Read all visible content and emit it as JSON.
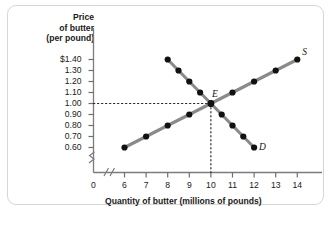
{
  "chart_data": {
    "type": "line",
    "title": "",
    "ylabel": "Price of butter (per pound)",
    "ylabel_lines": [
      "Price",
      "of butter",
      "(per pound)"
    ],
    "xlabel": "Quantity of butter (millions of pounds)",
    "xlim": [
      6,
      14
    ],
    "ylim": [
      0.6,
      1.4
    ],
    "x_origin_label": "0",
    "axis_break_x": true,
    "axis_break_y": true,
    "grid": false,
    "legend_position": "inline-curve-end",
    "ytick_labels": [
      "$1.40",
      "1.30",
      "1.20",
      "1.10",
      "1.00",
      "0.90",
      "0.80",
      "0.70",
      "0.60"
    ],
    "ytick_values": [
      1.4,
      1.3,
      1.2,
      1.1,
      1.0,
      0.9,
      0.8,
      0.7,
      0.6
    ],
    "xtick_labels": [
      "6",
      "7",
      "8",
      "9",
      "10",
      "11",
      "12",
      "13",
      "14"
    ],
    "xtick_values": [
      6,
      7,
      8,
      9,
      10,
      11,
      12,
      13,
      14
    ],
    "series": [
      {
        "name": "S",
        "label": "S",
        "color": "#8a8a8a",
        "marker_color": "#111111",
        "points": [
          {
            "x": 6.0,
            "y": 0.6
          },
          {
            "x": 7.0,
            "y": 0.7
          },
          {
            "x": 8.0,
            "y": 0.8
          },
          {
            "x": 9.0,
            "y": 0.9
          },
          {
            "x": 10.0,
            "y": 1.0
          },
          {
            "x": 11.0,
            "y": 1.1
          },
          {
            "x": 12.0,
            "y": 1.2
          },
          {
            "x": 13.0,
            "y": 1.3
          },
          {
            "x": 14.0,
            "y": 1.4
          }
        ]
      },
      {
        "name": "D",
        "label": "D",
        "color": "#8a8a8a",
        "marker_color": "#111111",
        "points": [
          {
            "x": 8.0,
            "y": 1.4
          },
          {
            "x": 8.5,
            "y": 1.3
          },
          {
            "x": 9.0,
            "y": 1.2
          },
          {
            "x": 9.5,
            "y": 1.1
          },
          {
            "x": 10.0,
            "y": 1.0
          },
          {
            "x": 10.5,
            "y": 0.9
          },
          {
            "x": 11.0,
            "y": 0.8
          },
          {
            "x": 11.5,
            "y": 0.7
          },
          {
            "x": 12.0,
            "y": 0.6
          }
        ]
      }
    ],
    "annotations": [
      {
        "label": "E",
        "x": 10.0,
        "y": 1.0,
        "type": "equilibrium",
        "guides": [
          "horizontal-to-axis",
          "vertical-to-axis"
        ]
      }
    ]
  }
}
